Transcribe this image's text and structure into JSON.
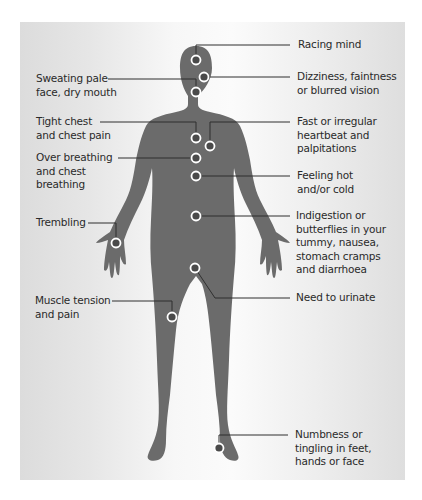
{
  "colors": {
    "panel_background": "#e4e4e4",
    "silhouette": "#6b6b6b",
    "marker_ring": "#ffffff",
    "marker_center": "#4a4a4a",
    "leader_line": "#2f2f2f",
    "text": "#2a2a2a"
  },
  "diagram": {
    "symptoms_left": [
      {
        "id": "sweating",
        "label": "Sweating pale\nface, dry mouth",
        "body_location": "face"
      },
      {
        "id": "tight-chest",
        "label": "Tight chest\nand chest pain",
        "body_location": "upper chest"
      },
      {
        "id": "over-breathing",
        "label": "Over breathing\nand chest\nbreathing",
        "body_location": "chest"
      },
      {
        "id": "trembling",
        "label": "Trembling",
        "body_location": "right hand (viewer's left)"
      },
      {
        "id": "muscle-tension",
        "label": "Muscle tension\nand pain",
        "body_location": "thigh"
      }
    ],
    "symptoms_right": [
      {
        "id": "racing-mind",
        "label": "Racing mind",
        "body_location": "top of head"
      },
      {
        "id": "dizziness",
        "label": "Dizziness, faintness\nor blurred vision",
        "body_location": "eyes"
      },
      {
        "id": "fast-heartbeat",
        "label": "Fast or irregular\nheartbeat and\npalpitations",
        "body_location": "heart"
      },
      {
        "id": "feeling-hot",
        "label": "Feeling hot\nand/or cold",
        "body_location": "sternum"
      },
      {
        "id": "indigestion",
        "label": "Indigestion or\nbutterflies in your\ntummy, nausea,\nstomach cramps\nand diarrhoea",
        "body_location": "stomach"
      },
      {
        "id": "urinate",
        "label": "Need to urinate",
        "body_location": "groin"
      },
      {
        "id": "numbness",
        "label": "Numbness or\ntingling in feet,\nhands or face",
        "body_location": "ankle"
      }
    ]
  }
}
